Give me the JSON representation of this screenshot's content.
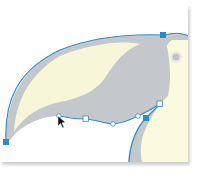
{
  "canvas": {
    "background": "#ffffff",
    "artboard_shadow": "#cfcfcf"
  },
  "illustration": {
    "subject": "toucan-beak",
    "colors": {
      "beak_gray": "#c4c8cc",
      "beak_yellow": "#f8f6d8",
      "body_cream": "#fbf9de",
      "eye_ring": "#e9ebe8",
      "eye": "#bfc2c6",
      "path_stroke": "#2f8fc8",
      "anchor_selected": "#2a8cc6",
      "anchor_unselected": "#ffffff"
    }
  },
  "path_selection": {
    "anchors_selected": [
      {
        "x": 163,
        "y": 35
      },
      {
        "x": 6,
        "y": 142
      },
      {
        "x": 146,
        "y": 118
      }
    ],
    "anchors_unselected": [
      {
        "x": 160,
        "y": 104
      },
      {
        "x": 86,
        "y": 119
      }
    ],
    "handles": [
      {
        "x": 59,
        "y": 116
      },
      {
        "x": 113,
        "y": 124
      },
      {
        "x": 138,
        "y": 116
      }
    ]
  },
  "cursor": {
    "type": "direct-selection-arrow",
    "x": 58,
    "y": 116
  }
}
